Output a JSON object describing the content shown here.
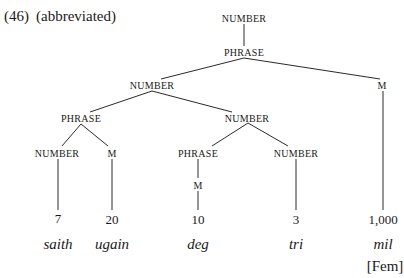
{
  "example": {
    "number": "(46)",
    "note": "(abbreviated)"
  },
  "tree": {
    "root": "NUMBER",
    "phrase_top": "PHRASE",
    "number_left": "NUMBER",
    "m_right": "M",
    "phrase_left": "PHRASE",
    "number_mid": "NUMBER",
    "number_ll": "NUMBER",
    "m_ll": "M",
    "phrase_mid": "PHRASE",
    "number_mr": "NUMBER",
    "m_mid": "M"
  },
  "leaves": [
    {
      "numeral": "7",
      "word": "saith"
    },
    {
      "numeral": "20",
      "word": "ugain"
    },
    {
      "numeral": "10",
      "word": "deg"
    },
    {
      "numeral": "3",
      "word": "tri"
    },
    {
      "numeral": "1,000",
      "word": "mil",
      "gender": "[Fem]"
    }
  ]
}
